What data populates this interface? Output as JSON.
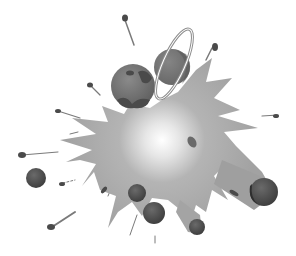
{
  "image": {
    "subject": "cosmic explosion clip-art",
    "width": 296,
    "height": 256,
    "background": "#ffffff"
  },
  "colors": {
    "burst": "#a9a9a9",
    "burst_core": "#ffffff",
    "planet_dark": "#5a5a5a",
    "planet_mid": "#7a7a7a",
    "planet_shadow": "#3e3e3e",
    "ring": "#8a8a8a",
    "debris": "#4a4a4a",
    "streak": "#9a9a9a"
  },
  "elements": {
    "explosion": {
      "cx": 162,
      "cy": 140
    },
    "planet_left": {
      "cx": 133,
      "cy": 86,
      "r": 22
    },
    "ringed_planet": {
      "cx": 172,
      "cy": 67,
      "r": 18
    },
    "orbs": [
      {
        "cx": 36,
        "cy": 178,
        "r": 10
      },
      {
        "cx": 137,
        "cy": 193,
        "r": 9
      },
      {
        "cx": 154,
        "cy": 213,
        "r": 11
      },
      {
        "cx": 197,
        "cy": 227,
        "r": 8
      },
      {
        "cx": 264,
        "cy": 192,
        "r": 13
      }
    ]
  }
}
